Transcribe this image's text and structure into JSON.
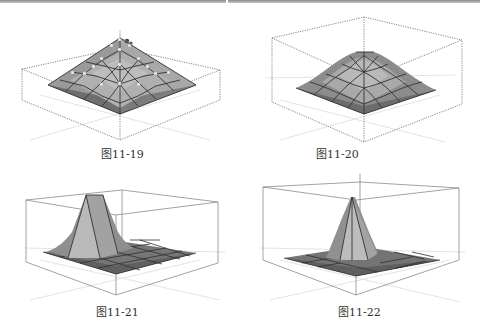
{
  "page": {
    "header_rule": true
  },
  "figures": [
    {
      "id": "fig-11-19",
      "caption": "图11-19",
      "description": "Pyramid-shaped mesh surface with selected vertices highlighted and a transform gizmo at the apex, inside a dotted bounding box"
    },
    {
      "id": "fig-11-20",
      "caption": "图11-20",
      "description": "Smooth bell-shaped mesh surface (relaxed) inside a dotted bounding box"
    },
    {
      "id": "fig-11-21",
      "caption": "图11-21",
      "description": "Flat grid mesh with a raised truncated-pyramid bump near the left side inside a bounding box"
    },
    {
      "id": "fig-11-22",
      "caption": "图11-22",
      "description": "Flat grid mesh with a sharp cone spike at the center inside a bounding box"
    }
  ],
  "colors": {
    "surface_light": "#b4b4b4",
    "surface_mid": "#8e8e8e",
    "surface_dark": "#6c6c6c",
    "grid_line": "#3a3a3a",
    "box_line": "#7a7a7a",
    "axis_line": "#d8d8d8",
    "vertex_highlight": "#e8e8e8",
    "caption_text": "#333333"
  }
}
